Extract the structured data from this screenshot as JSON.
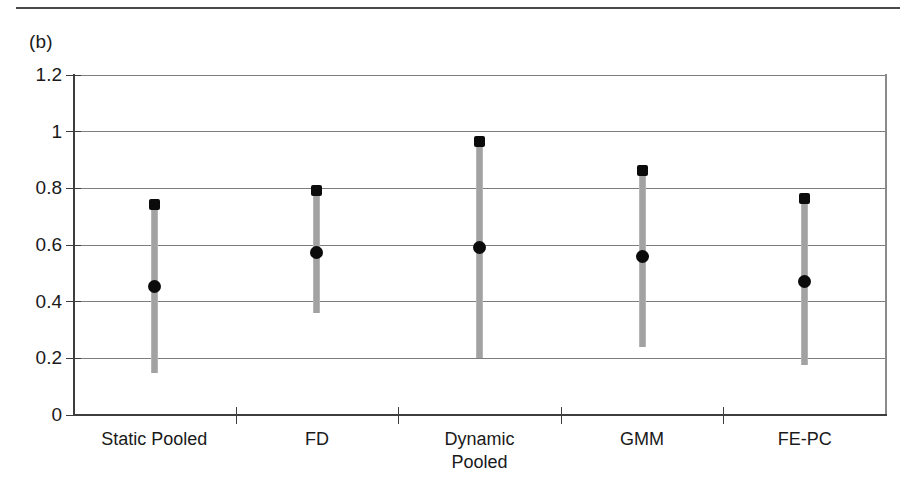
{
  "figure": {
    "panel_label": "(b)",
    "has_top_rule": true
  },
  "chart_data": {
    "type": "scatter",
    "title": "",
    "subtitle": "",
    "xlabel": "",
    "ylabel": "",
    "categories": [
      "Static Pooled",
      "FD",
      "Dynamic\nPooled",
      "GMM",
      "FE-PC"
    ],
    "ylim": [
      0,
      1.2
    ],
    "yticks": [
      0,
      0.2,
      0.4,
      0.6,
      0.8,
      1,
      1.2
    ],
    "ytick_labels": [
      "0",
      "0.2",
      "0.4",
      "0.6",
      "0.8",
      "1",
      "1.2"
    ],
    "grid": true,
    "grid_axis": "y",
    "legend": "none",
    "marker_color": "#0b0b0b",
    "bar_color": "#a2a2a2",
    "series": [
      {
        "name": "Point estimate",
        "values": [
          0.455,
          0.575,
          0.59,
          0.56,
          0.47
        ]
      },
      {
        "name": "Interval upper",
        "values": [
          0.75,
          0.8,
          0.97,
          0.87,
          0.77
        ]
      },
      {
        "name": "Interval lower",
        "values": [
          0.15,
          0.36,
          0.2,
          0.24,
          0.175
        ]
      }
    ],
    "points": [
      {
        "category": "Static Pooled",
        "estimate": 0.455,
        "upper": 0.75,
        "lower": 0.15
      },
      {
        "category": "FD",
        "estimate": 0.575,
        "upper": 0.8,
        "lower": 0.36
      },
      {
        "category": "Dynamic Pooled",
        "estimate": 0.59,
        "upper": 0.97,
        "lower": 0.2
      },
      {
        "category": "GMM",
        "estimate": 0.56,
        "upper": 0.87,
        "lower": 0.24
      },
      {
        "category": "FE-PC",
        "estimate": 0.47,
        "upper": 0.77,
        "lower": 0.175
      }
    ]
  }
}
